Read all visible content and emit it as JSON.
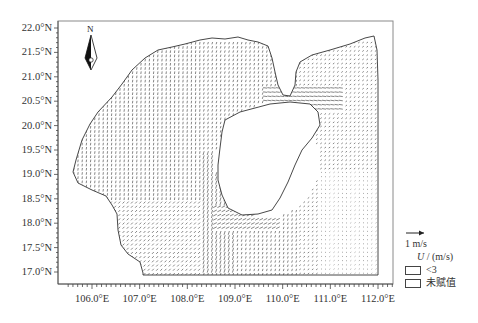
{
  "map": {
    "title": "",
    "region": "Beibu Gulf / Qiongzhou Strait",
    "frame_color": "#888888",
    "vector_color": "#222222",
    "coast_color": "#333333",
    "north_arrow": {
      "label": "N"
    },
    "y_axis": {
      "labels": [
        "22.0°N",
        "21.5°N",
        "21.0°N",
        "20.5°N",
        "20.0°N",
        "19.5°N",
        "19.0°N",
        "18.5°N",
        "18.0°N",
        "17.5°N",
        "17.0°N"
      ]
    },
    "x_axis": {
      "labels": [
        "106.0°E",
        "107.0°E",
        "108.0°E",
        "109.0°E",
        "110.0°E",
        "111.0°E",
        "112.0°E"
      ]
    },
    "legend": {
      "scale_label": "1 m/s",
      "variable_symbol": "U",
      "variable_unit": " / (m/s)",
      "items": [
        {
          "label": "<3",
          "fill": "#ffffff"
        },
        {
          "label": "未赋值",
          "fill": "#ffffff"
        }
      ]
    }
  }
}
